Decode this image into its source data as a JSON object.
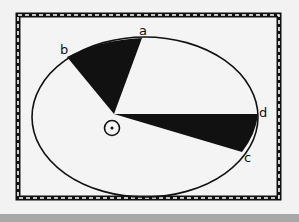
{
  "diagram": {
    "labels": {
      "a": "a",
      "b": "b",
      "c": "c",
      "d": "d"
    },
    "colors": {
      "frame": "#111111",
      "fill": "#111111",
      "background": "#f2f2f2",
      "bottom_bar": "#a8a8a8"
    }
  }
}
